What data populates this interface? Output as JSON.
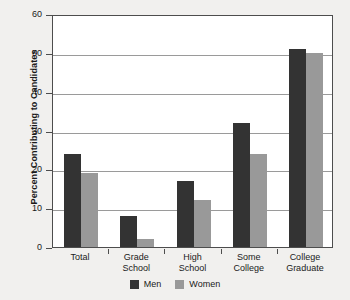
{
  "chart_data": {
    "type": "bar",
    "title": "",
    "xlabel": "",
    "ylabel": "Percent Contributing to Candidates",
    "ylim": [
      0,
      60
    ],
    "ytick_labels": [
      "0",
      "10",
      "20",
      "30",
      "40",
      "50",
      "60"
    ],
    "ytick_values": [
      0,
      10,
      20,
      30,
      40,
      50,
      60
    ],
    "grid": true,
    "legend_position": "bottom-center",
    "categories": [
      "Total",
      "Grade School",
      "High School",
      "Some College",
      "College Graduate"
    ],
    "category_lines": [
      [
        "Total"
      ],
      [
        "Grade",
        "School"
      ],
      [
        "High",
        "School"
      ],
      [
        "Some",
        "College"
      ],
      [
        "College",
        "Graduate"
      ]
    ],
    "series": [
      {
        "name": "Men",
        "color": "#333333",
        "values": [
          24,
          8,
          17,
          32,
          51
        ]
      },
      {
        "name": "Women",
        "color": "#999999",
        "values": [
          19,
          2,
          12,
          24,
          50
        ]
      }
    ]
  },
  "legend": {
    "items": [
      {
        "label": "Men",
        "color": "#333333"
      },
      {
        "label": "Women",
        "color": "#999999"
      }
    ]
  },
  "colors": {
    "background": "#f1f0ee",
    "plot_background": "#ffffff",
    "axis": "#4d4d4d",
    "gridline": "#9a9a9a",
    "text": "#1a1a1a",
    "men": "#333333",
    "women": "#999999"
  }
}
